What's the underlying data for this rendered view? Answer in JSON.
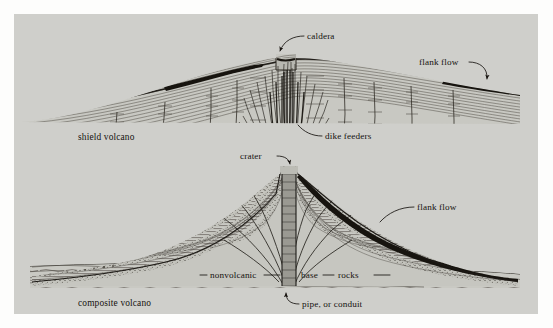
{
  "figure": {
    "background_color": "#cfcfcb",
    "ink_color": "#17130f",
    "page_color": "#fdfdfc"
  },
  "diagrams": [
    {
      "id": "shield-volcano",
      "caption": "shield volcano",
      "description": "Broad low-profile cross section built of many thin lava flows, with a summit caldera and a swarm of near-vertical dike feeders rising through the pile.",
      "labels": [
        {
          "id": "caldera",
          "text": "caldera"
        },
        {
          "id": "flank-flow",
          "text": "flank flow"
        },
        {
          "id": "dike-feeders",
          "text": "dike feeders"
        }
      ]
    },
    {
      "id": "composite-volcano",
      "caption": "composite volcano",
      "description": "Steep-sided cross section of alternating pyroclastic and lava layers over nonvolcanic base rocks, fed by a central pipe that opens into a summit crater.",
      "labels": [
        {
          "id": "crater",
          "text": "crater"
        },
        {
          "id": "flank-flow",
          "text": "flank flow"
        },
        {
          "id": "nonvolcanic",
          "text": "nonvolcanic"
        },
        {
          "id": "base",
          "text": "base"
        },
        {
          "id": "rocks",
          "text": "rocks"
        },
        {
          "id": "pipe-or-conduit",
          "text": "pipe, or conduit"
        }
      ]
    }
  ]
}
